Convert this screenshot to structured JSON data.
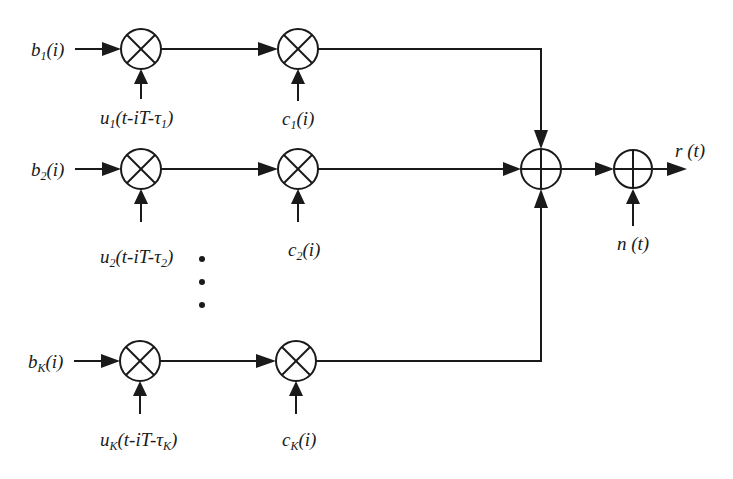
{
  "diagram": {
    "type": "block-diagram",
    "rows": [
      {
        "input": {
          "base": "b",
          "sub": "1",
          "arg": "(i)"
        },
        "waveform": {
          "base": "u",
          "sub": "1",
          "arg_pre": "(t-iT-τ",
          "arg_sub": "1",
          "arg_post": ")"
        },
        "code": {
          "base": "c",
          "sub": "1",
          "arg": "(i)"
        }
      },
      {
        "input": {
          "base": "b",
          "sub": "2",
          "arg": "(i)"
        },
        "waveform": {
          "base": "u",
          "sub": "2",
          "arg_pre": "(t-iT-τ",
          "arg_sub": "2",
          "arg_post": ")"
        },
        "code": {
          "base": "c",
          "sub": "2",
          "arg": "(i)"
        }
      },
      {
        "input": {
          "base": "b",
          "sub": "K",
          "arg": "(i)"
        },
        "waveform": {
          "base": "u",
          "sub": "K",
          "arg_pre": "(t-iT-τ",
          "arg_sub": "K",
          "arg_post": ")"
        },
        "code": {
          "base": "c",
          "sub": "K",
          "arg": "(i)"
        }
      }
    ],
    "ellipsis": "⋮",
    "noise": "n (t)",
    "output": "r (t)",
    "multiplier_symbol": "⊗",
    "adder_symbol": "⊕",
    "colors": {
      "stroke": "#1a1a1a",
      "background": "#ffffff"
    }
  }
}
